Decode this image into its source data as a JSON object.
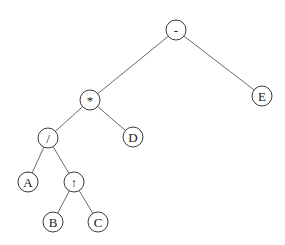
{
  "diagram": {
    "type": "expression-tree",
    "node_radius": 10,
    "colors": {
      "background": "#ffffff",
      "edge": "#6a6a6a",
      "node_stroke": "#3a3a3a",
      "node_fill": "#ffffff",
      "label": "#1a1a1a"
    },
    "nodes": [
      {
        "id": "minus",
        "label": "-",
        "x": 176,
        "y": 30
      },
      {
        "id": "mul",
        "label": "*",
        "x": 90,
        "y": 100
      },
      {
        "id": "E",
        "label": "E",
        "x": 262,
        "y": 96
      },
      {
        "id": "div",
        "label": "/",
        "x": 48,
        "y": 138
      },
      {
        "id": "D",
        "label": "D",
        "x": 133,
        "y": 137
      },
      {
        "id": "A",
        "label": "A",
        "x": 28,
        "y": 182
      },
      {
        "id": "pow",
        "label": "↑",
        "x": 74,
        "y": 182
      },
      {
        "id": "B",
        "label": "B",
        "x": 53,
        "y": 222
      },
      {
        "id": "C",
        "label": "C",
        "x": 98,
        "y": 222
      }
    ],
    "edges": [
      {
        "from": "minus",
        "to": "mul"
      },
      {
        "from": "minus",
        "to": "E"
      },
      {
        "from": "mul",
        "to": "div"
      },
      {
        "from": "mul",
        "to": "D"
      },
      {
        "from": "div",
        "to": "A"
      },
      {
        "from": "div",
        "to": "pow"
      },
      {
        "from": "pow",
        "to": "B"
      },
      {
        "from": "pow",
        "to": "C"
      }
    ]
  }
}
